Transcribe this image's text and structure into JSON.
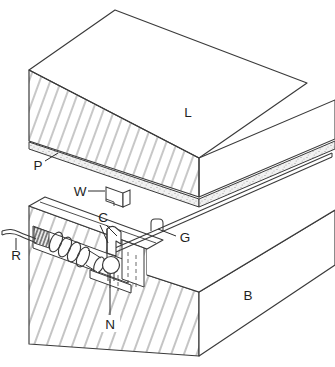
{
  "figure": {
    "background_color": "#ffffff",
    "line_color": "#3a3a3a",
    "hatch_color": "#8f8f8f",
    "labels": {
      "upper_block": "L",
      "lower_block": "B",
      "plate": "P",
      "wedge": "W",
      "clamp": "C",
      "rod": "G",
      "spring_wire": "R",
      "roller": "N"
    }
  }
}
